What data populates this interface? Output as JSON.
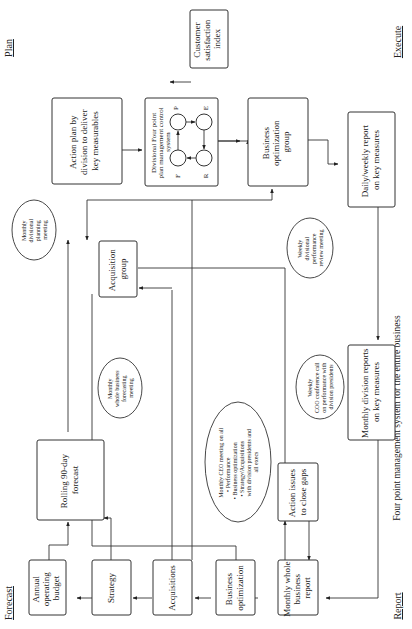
{
  "corner_labels": {
    "plan": "Plan",
    "execute": "Execute",
    "forecast": "Forecast",
    "report": "Report"
  },
  "caption": "Four point management system for the entire business",
  "boxes": {
    "action_plan": [
      "Action plan by",
      "division to deliver",
      "key measurables"
    ],
    "customer_satisfaction": [
      "Customer",
      "satisfaction",
      "index"
    ],
    "divisional_fourpoint": [
      "Divisional Four point",
      "plan management control",
      "system"
    ],
    "business_optimization_group": [
      "Business",
      "optimization",
      "group"
    ],
    "daily_weekly_report": [
      "Daily/weekly report",
      "on key measures"
    ],
    "acquisition_group": [
      "Acquisition",
      "group"
    ],
    "monthly_division_reports": [
      "Monthly division reports",
      "on key measures"
    ],
    "rolling_forecast": [
      "Rolling 90-day",
      "forecast"
    ],
    "action_issues": [
      "Action issues",
      "to close gaps"
    ],
    "annual_budget": [
      "Annual",
      "operating",
      "budget"
    ],
    "strategy": [
      "Strategy"
    ],
    "acquisitions": [
      "Acquisitions"
    ],
    "business_optimization": [
      "Business",
      "optimization"
    ],
    "monthly_whole_report": [
      "Monthly whole",
      "business",
      "report"
    ]
  },
  "cycle_nodes": {
    "p": "P",
    "e": "E",
    "r": "R",
    "f": "F"
  },
  "clouds": {
    "monthly_divisional_planning": [
      "Monthly",
      "divisional",
      "planning",
      "meeting"
    ],
    "monthly_whole_forecasting": [
      "Monthly",
      "whole business",
      "forecasting",
      "meeting"
    ],
    "weekly_divisional_review": [
      "Weekly",
      "divisional",
      "performance",
      "review meeting"
    ],
    "weekly_coo_call": [
      "Weekly",
      "COO conference call",
      "on performance with",
      "division presidents"
    ],
    "monthly_ceo_meeting": [
      "Monthly CEO meeting on all",
      "• Performance",
      "• Business optimization",
      "• Strategy/Acquisitions",
      "with division presidents and",
      "all execs"
    ]
  }
}
